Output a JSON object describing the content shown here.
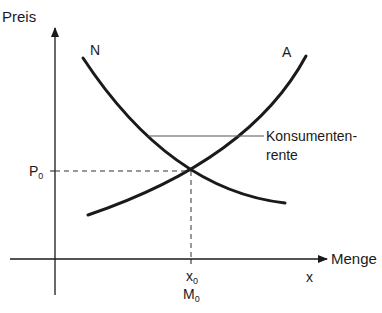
{
  "diagram": {
    "type": "supply-demand",
    "y_axis": {
      "label": "Preis"
    },
    "x_axis": {
      "label": "Menge",
      "variable": "x"
    },
    "curves": [
      {
        "name": "N",
        "meaning": "Nachfrage"
      },
      {
        "name": "A",
        "meaning": "Angebot"
      }
    ],
    "equilibrium": {
      "price": {
        "base": "P",
        "subscript": "0"
      },
      "quantity": {
        "base": "x",
        "subscript": "0"
      },
      "quantity_alt": {
        "base": "M",
        "subscript": "0"
      }
    },
    "annotation": {
      "line1": "Konsumenten-",
      "line2": "rente"
    },
    "colors": {
      "ink": "#1a1a1a",
      "background": "#ffffff"
    }
  }
}
